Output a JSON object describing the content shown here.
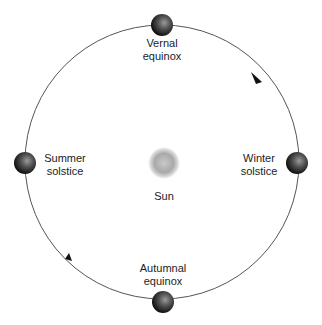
{
  "center_label": "Sun",
  "positions": [
    {
      "id": "vernal",
      "line1": "Vernal",
      "line2": "equinox"
    },
    {
      "id": "summer",
      "line1": "Summer",
      "line2": "solstice"
    },
    {
      "id": "winter",
      "line1": "Winter",
      "line2": "solstice"
    },
    {
      "id": "autumnal",
      "line1": "Autumnal",
      "line2": "equinox"
    }
  ],
  "orbit_direction": "counterclockwise",
  "colors": {
    "orbit": "#555555",
    "sun": "#b0b0b0",
    "earth": "#333333"
  }
}
